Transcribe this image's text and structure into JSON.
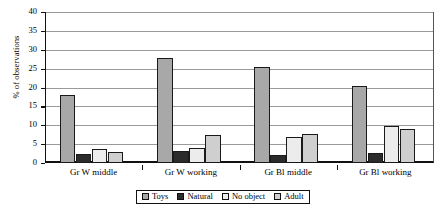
{
  "chart_data": {
    "type": "bar",
    "title": "",
    "xlabel": "",
    "ylabel": "% of observations",
    "ylim": [
      0,
      40
    ],
    "yticks": [
      0,
      5,
      10,
      15,
      20,
      25,
      30,
      35,
      40
    ],
    "grid": true,
    "legend_position": "bottom",
    "categories": [
      "Gr W middle",
      "Gr W working",
      "Gr Bl middle",
      "Gr Bl working"
    ],
    "series": [
      {
        "name": "Toys",
        "color": "#a8a8a8",
        "values": [
          18.1,
          27.8,
          25.5,
          20.3
        ]
      },
      {
        "name": "Natural",
        "color": "#2b2b2b",
        "values": [
          2.4,
          3.3,
          2.2,
          2.7
        ]
      },
      {
        "name": "No object",
        "color": "#ececec",
        "values": [
          3.6,
          4.0,
          7.0,
          9.8
        ]
      },
      {
        "name": "Adult",
        "color": "#cfcfcf",
        "values": [
          3.0,
          7.3,
          7.7,
          9.0
        ]
      }
    ]
  },
  "axis": {
    "y_title": "% of observations"
  },
  "legend": {
    "items": [
      {
        "label": "Toys",
        "color": "#a8a8a8"
      },
      {
        "label": "Natural",
        "color": "#2b2b2b"
      },
      {
        "label": "No object",
        "color": "#ececec"
      },
      {
        "label": "Adult",
        "color": "#cfcfcf"
      }
    ]
  }
}
